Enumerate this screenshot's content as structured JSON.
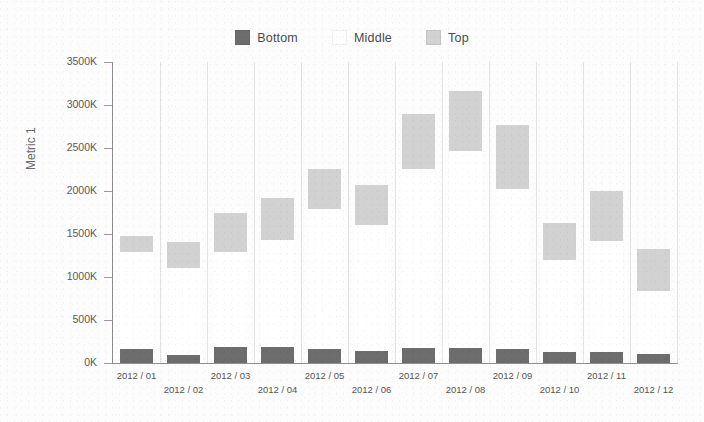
{
  "chart_data": {
    "type": "bar",
    "subtype": "stacked-bar",
    "title": "",
    "xlabel": "",
    "ylabel": "Metric 1",
    "ylim": [
      0,
      3500000
    ],
    "ytick_values": [
      0,
      500000,
      1000000,
      1500000,
      2000000,
      2500000,
      3000000,
      3500000
    ],
    "ytick_labels": [
      "0K",
      "500K",
      "1000K",
      "1500K",
      "2000K",
      "2500K",
      "3000K",
      "3500K"
    ],
    "categories": [
      "2012 / 01",
      "2012 / 02",
      "2012 / 03",
      "2012 / 04",
      "2012 / 05",
      "2012 / 06",
      "2012 / 07",
      "2012 / 08",
      "2012 / 09",
      "2012 / 10",
      "2012 / 11",
      "2012 / 12"
    ],
    "grid": "vertical",
    "legend_position": "top-center",
    "series": [
      {
        "name": "Bottom",
        "color": "#6d6d6d",
        "values": [
          160000,
          95000,
          185000,
          185000,
          160000,
          140000,
          175000,
          175000,
          165000,
          130000,
          130000,
          105000
        ]
      },
      {
        "name": "Middle",
        "color": "#ffffff",
        "values": [
          1130000,
          1015000,
          1105000,
          1245000,
          1635000,
          1470000,
          2080000,
          2290000,
          1855000,
          1070000,
          1290000,
          730000
        ]
      },
      {
        "name": "Top",
        "color": "#d2d2d2",
        "values": [
          190000,
          295000,
          460000,
          490000,
          465000,
          460000,
          640000,
          700000,
          745000,
          430000,
          580000,
          490000
        ]
      }
    ]
  },
  "legend": {
    "items": [
      {
        "label": "Bottom",
        "color": "#6d6d6d"
      },
      {
        "label": "Middle",
        "color": "#ffffff"
      },
      {
        "label": "Top",
        "color": "#d2d2d2"
      }
    ]
  },
  "axis": {
    "y_title": "Metric 1"
  }
}
